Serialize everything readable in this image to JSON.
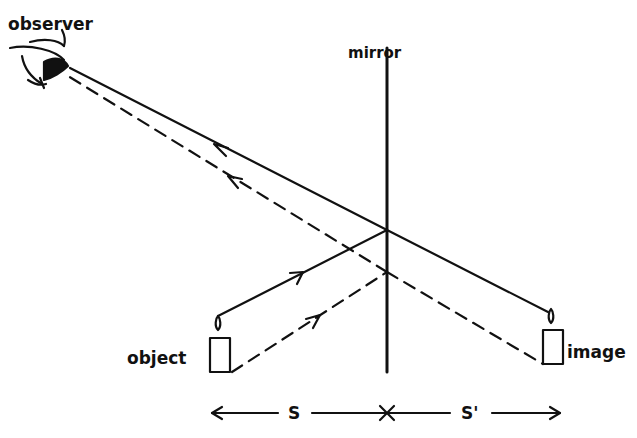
{
  "diagram": {
    "type": "plane-mirror-ray-diagram",
    "labels": {
      "observer": "observer",
      "mirror": "mirror",
      "object": "object",
      "image": "image",
      "object_distance": "S",
      "image_distance": "S'"
    },
    "colors": {
      "ink": "#111111",
      "background": "#ffffff"
    },
    "elements": {
      "mirror_line": {
        "x": 387,
        "y1": 48,
        "y2": 372
      },
      "reflection_point_solid": {
        "x": 387,
        "y": 230
      },
      "reflection_point_dashed": {
        "x": 387,
        "y": 272
      },
      "object_candle": {
        "x": 210,
        "y": 338,
        "w": 20,
        "h": 34
      },
      "image_candle": {
        "x": 543,
        "y": 330,
        "w": 20,
        "h": 34
      }
    },
    "rays": [
      {
        "name": "incident-solid",
        "style": "solid",
        "from": "object-flame",
        "to": "mirror"
      },
      {
        "name": "reflected-solid",
        "style": "solid",
        "from": "mirror",
        "to": "observer"
      },
      {
        "name": "incident-dashed",
        "style": "dashed",
        "from": "object-base",
        "to": "mirror"
      },
      {
        "name": "reflected-dashed",
        "style": "dashed",
        "from": "mirror",
        "to": "observer"
      },
      {
        "name": "virtual-solid",
        "style": "solid",
        "from": "mirror",
        "to": "image-flame"
      },
      {
        "name": "virtual-dashed",
        "style": "dashed",
        "from": "mirror",
        "to": "image-base"
      }
    ]
  }
}
